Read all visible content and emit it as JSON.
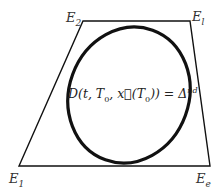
{
  "diagram": {
    "corners": {
      "top_left": {
        "base": "E",
        "sub": "2"
      },
      "top_right": {
        "base": "E",
        "sub": "l"
      },
      "bottom_left": {
        "base": "E",
        "sub": "1"
      },
      "bottom_right": {
        "base": "E",
        "sub": "e"
      }
    },
    "formula": {
      "lhs": "D(t, T",
      "sub0": "0",
      "mid": ", x⃗(T",
      "sub1": "0",
      "close": ")) = Δ",
      "sup": "nd"
    },
    "colors": {
      "stroke": "#111111",
      "background": "#ffffff"
    }
  }
}
